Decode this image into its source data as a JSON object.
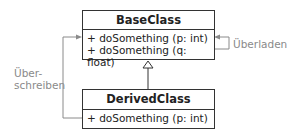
{
  "diagram": {
    "type": "uml-class",
    "classes": [
      {
        "name": "BaseClass",
        "methods": [
          "+ doSomething (p: int)",
          "+ doSomething (q: float)"
        ]
      },
      {
        "name": "DerivedClass",
        "methods": [
          "+ doSomething (p: int)"
        ]
      }
    ],
    "relations": [
      {
        "type": "inheritance",
        "from": "DerivedClass",
        "to": "BaseClass"
      },
      {
        "type": "override",
        "from": "DerivedClass",
        "to": "BaseClass",
        "label_line1": "Über-",
        "label_line2": "schreiben"
      },
      {
        "type": "overload",
        "from": "BaseClass",
        "to": "BaseClass",
        "label": "Überladen"
      }
    ]
  },
  "colors": {
    "box_border": "#333333",
    "text": "#222222",
    "connector": "#8a8a8a",
    "label": "#8a8a8a"
  }
}
